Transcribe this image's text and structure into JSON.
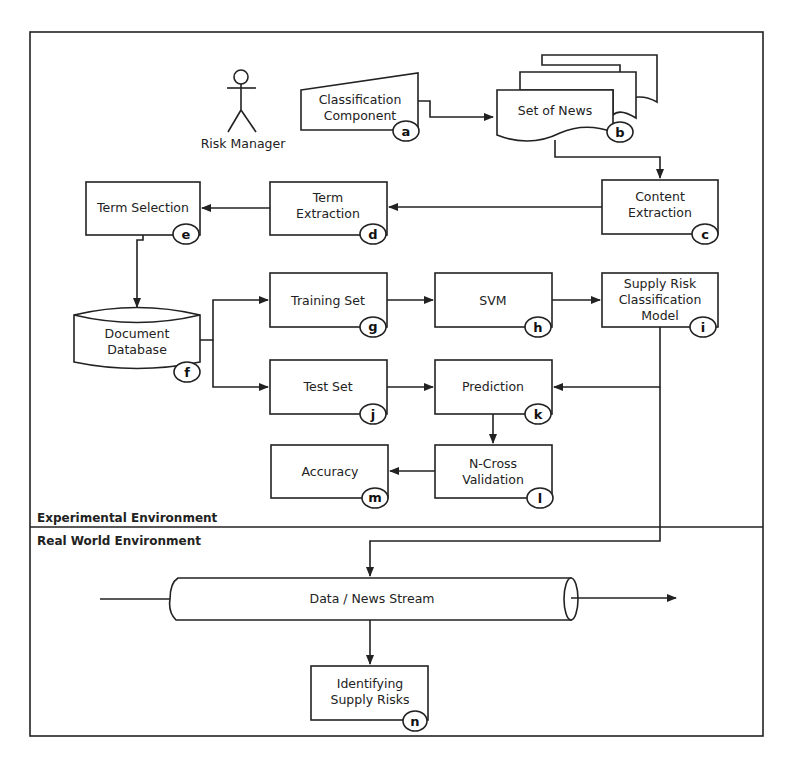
{
  "diagram": {
    "actor": {
      "label": "Risk Manager"
    },
    "environments": {
      "experimental": "Experimental Environment",
      "real_world": "Real World Environment"
    },
    "nodes": {
      "a": {
        "line1": "Classification",
        "line2": "Component",
        "badge": "a",
        "shape": "manual-input"
      },
      "b": {
        "line1": "Set of News",
        "badge": "b",
        "shape": "multi-document"
      },
      "c": {
        "line1": "Content",
        "line2": "Extraction",
        "badge": "c",
        "shape": "process"
      },
      "d": {
        "line1": "Term",
        "line2": "Extraction",
        "badge": "d",
        "shape": "process"
      },
      "e": {
        "line1": "Term Selection",
        "badge": "e",
        "shape": "process"
      },
      "f": {
        "line1": "Document",
        "line2": "Database",
        "badge": "f",
        "shape": "database"
      },
      "g": {
        "line1": "Training Set",
        "badge": "g",
        "shape": "process"
      },
      "h": {
        "line1": "SVM",
        "badge": "h",
        "shape": "process"
      },
      "i": {
        "line1": "Supply Risk",
        "line2": "Classification",
        "line3": "Model",
        "badge": "i",
        "shape": "process"
      },
      "j": {
        "line1": "Test Set",
        "badge": "j",
        "shape": "process"
      },
      "k": {
        "line1": "Prediction",
        "badge": "k",
        "shape": "process"
      },
      "l": {
        "line1": "N-Cross",
        "line2": "Validation",
        "badge": "l",
        "shape": "process"
      },
      "m": {
        "line1": "Accuracy",
        "badge": "m",
        "shape": "process"
      },
      "stream": {
        "line1": "Data / News Stream",
        "shape": "pipe"
      },
      "n": {
        "line1": "Identifying",
        "line2": "Supply Risks",
        "badge": "n",
        "shape": "process"
      }
    },
    "edges": [
      [
        "a",
        "b"
      ],
      [
        "b",
        "c"
      ],
      [
        "c",
        "d"
      ],
      [
        "d",
        "e"
      ],
      [
        "e",
        "f"
      ],
      [
        "f",
        "g"
      ],
      [
        "f",
        "j"
      ],
      [
        "g",
        "h"
      ],
      [
        "h",
        "i"
      ],
      [
        "i",
        "k"
      ],
      [
        "j",
        "k"
      ],
      [
        "k",
        "l"
      ],
      [
        "l",
        "m"
      ],
      [
        "i",
        "stream"
      ],
      [
        "stream",
        "n"
      ]
    ]
  }
}
